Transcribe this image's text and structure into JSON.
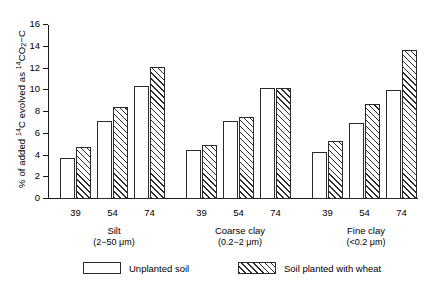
{
  "chart_data": {
    "type": "bar",
    "title": "",
    "xlabel": "",
    "ylabel": "% of added 14C evolved as 14CO2-C",
    "ylim": [
      0,
      16
    ],
    "yticks": [
      0,
      2,
      4,
      6,
      8,
      10,
      12,
      14,
      16
    ],
    "grid": false,
    "legend_position": "bottom",
    "groups": [
      {
        "name": "Silt",
        "size_range": "(2−50 μm)",
        "categories": [
          "39",
          "54",
          "74"
        ]
      },
      {
        "name": "Coarse clay",
        "size_range": "(0.2−2 μm)",
        "categories": [
          "39",
          "54",
          "74"
        ]
      },
      {
        "name": "Fine clay",
        "size_range": "(<0.2 μm)",
        "categories": [
          "39",
          "54",
          "74"
        ]
      }
    ],
    "categories": [
      "39",
      "54",
      "74"
    ],
    "series": [
      {
        "name": "Unplanted soil",
        "style": "open",
        "values_by_group": {
          "Silt": [
            3.8,
            7.2,
            10.4
          ],
          "Coarse clay": [
            4.5,
            7.2,
            10.2
          ],
          "Fine clay": [
            4.3,
            7.0,
            10.0
          ]
        }
      },
      {
        "name": "Soil planted with wheat",
        "style": "hatched",
        "values_by_group": {
          "Silt": [
            4.8,
            8.5,
            12.1
          ],
          "Coarse clay": [
            5.0,
            7.5,
            10.2
          ],
          "Fine clay": [
            5.3,
            8.7,
            13.7
          ]
        }
      }
    ]
  },
  "axis": {
    "y_title_prefix": "% of added ",
    "y_title_iso1": "14",
    "y_title_mid": "C evolved as ",
    "y_title_iso2": "14",
    "y_title_co": "CO",
    "y_title_sub": "2",
    "y_title_suffix": "−C"
  },
  "legend": {
    "items": [
      {
        "label": "Unplanted soil",
        "style": "open"
      },
      {
        "label": "Soil planted with wheat",
        "style": "hatched"
      }
    ]
  },
  "colors": {
    "ink": "#1a1a1a",
    "bar_stroke": "#2b2b2b",
    "background": "#ffffff"
  }
}
